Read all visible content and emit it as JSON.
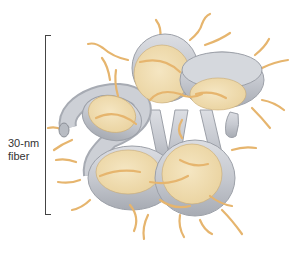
{
  "diagram": {
    "label_line1": "30-nm",
    "label_line2": "fiber",
    "colors": {
      "nucleosome_core": "#F0DDB0",
      "dna_tube": "#C9CCD3",
      "dna_tube_edge": "#9CA0A8",
      "histone_tail": "#E6B56E",
      "bracket": "#444444",
      "label": "#333333"
    },
    "nucleosome_count": 5
  }
}
